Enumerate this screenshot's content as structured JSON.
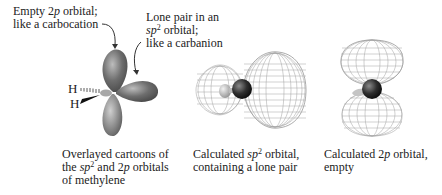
{
  "callouts": {
    "empty_2p": {
      "line1_prefix": "Empty 2",
      "line1_italic": "p",
      "line1_suffix": " orbital;",
      "line2": "like a carbocation"
    },
    "lone_pair": {
      "line1": "Lone pair in an",
      "line2_italic": "sp",
      "line2_sup": "2",
      "line2_suffix": " orbital;",
      "line3": "like a carbanion"
    }
  },
  "atoms": {
    "h_top": "H",
    "h_bottom": "H"
  },
  "captions": {
    "cartoon": {
      "line1": "Overlayed cartoons of",
      "line2_prefix": "the ",
      "line2_italic1": "sp",
      "line2_sup": "2",
      "line2_mid": " and 2",
      "line2_italic2": "p",
      "line2_suffix": " orbitals",
      "line3": "of methylene"
    },
    "sp2_calc": {
      "line1_prefix": "Calculated ",
      "line1_italic": "sp",
      "line1_sup": "2",
      "line1_suffix": " orbital,",
      "line2": "containing a lone pair"
    },
    "p_calc": {
      "line1_prefix": "Calculated 2",
      "line1_italic": "p",
      "line1_suffix": " orbital,",
      "line2": "empty"
    }
  },
  "colors": {
    "text": "#222222",
    "lobe_dark": "#5a5a5a",
    "lobe_light": "#c8c8c8",
    "mesh": "#9a9a9a",
    "carbon": "#2a2a2a"
  }
}
